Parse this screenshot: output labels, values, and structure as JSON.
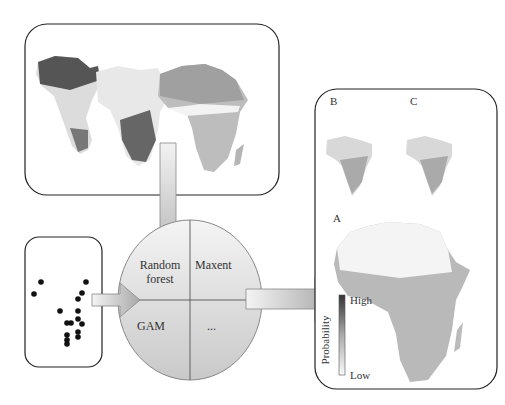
{
  "diagram": {
    "type": "species distribution modelling workflow",
    "inputs": {
      "environmental_layers": "Africa environmental predictor maps (3 layers)",
      "occurrences": "occurrence points map"
    },
    "models": {
      "top_left": "Random forest",
      "top_right": "Maxent",
      "bottom_left": "GAM",
      "bottom_right": "..."
    },
    "outputs": {
      "panel_b": "B",
      "panel_c": "C",
      "panel_a": "A",
      "legend": {
        "title": "Probability",
        "high": "High",
        "low": "Low"
      }
    }
  }
}
